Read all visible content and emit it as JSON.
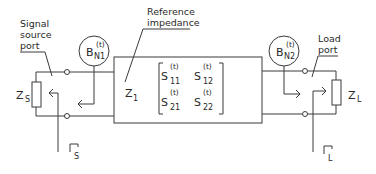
{
  "diagram": {
    "labels": {
      "signal_source_port": [
        "Signal",
        "source",
        "port"
      ],
      "reference_impedance": [
        "Reference",
        "impedance"
      ],
      "load_port": [
        "Load",
        "port"
      ]
    },
    "source_impedance": {
      "symbol": "Z",
      "sub": "S"
    },
    "load_impedance": {
      "symbol": "Z",
      "sub": "L"
    },
    "reference_z": {
      "symbol": "Z",
      "sub": "1"
    },
    "noise_source_1": {
      "symbol": "B",
      "sup": "(t)",
      "sub": "N1"
    },
    "noise_source_2": {
      "symbol": "B",
      "sup": "(t)",
      "sub": "N2"
    },
    "gamma_s": {
      "sub": "S"
    },
    "gamma_l": {
      "sub": "L"
    },
    "matrix": {
      "s11": {
        "symbol": "S",
        "sup": "(t)",
        "sub": "11"
      },
      "s12": {
        "symbol": "S",
        "sup": "(t)",
        "sub": "12"
      },
      "s21": {
        "symbol": "S",
        "sup": "(t)",
        "sub": "21"
      },
      "s22": {
        "symbol": "S",
        "sup": "(t)",
        "sub": "22"
      }
    }
  }
}
